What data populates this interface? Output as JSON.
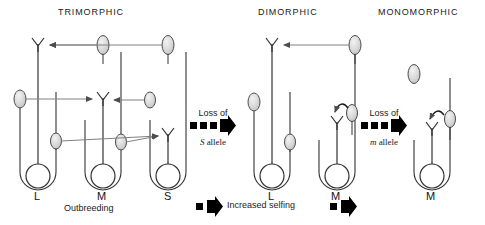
{
  "figure": {
    "panels": [
      {
        "id": "trimorphic",
        "title": "TRIMORPHIC",
        "caption": "Outbreeding",
        "morphs": [
          {
            "label": "L",
            "style": "long"
          },
          {
            "label": "M",
            "style": "mid"
          },
          {
            "label": "S",
            "style": "short"
          }
        ]
      },
      {
        "id": "dimorphic",
        "title": "DIMORPHIC",
        "caption": "",
        "morphs": [
          {
            "label": "L",
            "style": "long"
          },
          {
            "label": "M",
            "style": "mid"
          }
        ]
      },
      {
        "id": "monomorphic",
        "title": "MONOMORPHIC",
        "caption": "",
        "morphs": [
          {
            "label": "M",
            "style": "mid"
          }
        ]
      }
    ],
    "transitions": [
      {
        "id": "loss-s",
        "line1": "Loss  of",
        "allele": "S",
        "line2": "allele"
      },
      {
        "id": "loss-m",
        "line1": "Loss  of",
        "allele": "m",
        "line2": "allele"
      }
    ],
    "bottom_process": {
      "label": "Increased  selfing"
    },
    "colors": {
      "anther_fill": "#d9d9d9",
      "anther_stroke": "#4d4d4d",
      "stem": "#333333",
      "arrow": "#666666",
      "ink": "#1a1a1a",
      "transition_arrow": "#000000"
    }
  }
}
